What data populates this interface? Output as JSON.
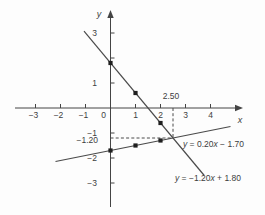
{
  "figure": {
    "background": "#fdfdfd",
    "axis_color": "#444444",
    "line_color": "#4a4a4a",
    "marker_color": "#1f1f1f",
    "guide_color": "#4a4a4a",
    "text_color": "#3d3d3d"
  },
  "chart_data": {
    "type": "line",
    "title": "",
    "xlabel": "x",
    "ylabel": "y",
    "xlim": [
      -3.8,
      5.3
    ],
    "ylim": [
      -3.9,
      3.9
    ],
    "grid": false,
    "x_ticks": [
      {
        "v": -3,
        "label": "−3"
      },
      {
        "v": -2,
        "label": "−2"
      },
      {
        "v": -1,
        "label": "−1"
      },
      {
        "v": 1,
        "label": "1"
      },
      {
        "v": 2,
        "label": "2"
      },
      {
        "v": 3,
        "label": "3"
      },
      {
        "v": 4,
        "label": "4"
      }
    ],
    "y_ticks": [
      {
        "v": 3,
        "label": "3"
      },
      {
        "v": 2,
        "label": ""
      },
      {
        "v": 1,
        "label": "1"
      },
      {
        "v": -1,
        "label": "−1"
      },
      {
        "v": -2,
        "label": "−2"
      },
      {
        "v": -3,
        "label": "−3"
      }
    ],
    "origin_label": "0",
    "series": [
      {
        "name": "y = −1.20x + 1.80",
        "slope": -1.2,
        "intercept": 1.8,
        "x_range": [
          -1.06,
          3.75
        ],
        "points": [
          [
            0,
            1.8
          ],
          [
            1,
            0.6
          ],
          [
            2,
            -0.6
          ]
        ],
        "label_parts": [
          {
            "t": "y",
            "i": 1
          },
          {
            "t": " = −1.20",
            "i": 0
          },
          {
            "t": "x",
            "i": 1
          },
          {
            "t": " + 1.80",
            "i": 0
          }
        ],
        "label_pos": [
          2.58,
          -2.92
        ]
      },
      {
        "name": "y = 0.20x − 1.70",
        "slope": 0.2,
        "intercept": -1.7,
        "x_range": [
          -2.2,
          4.8
        ],
        "points": [
          [
            0,
            -1.7
          ],
          [
            1,
            -1.5
          ],
          [
            2,
            -1.3
          ]
        ],
        "label_parts": [
          {
            "t": "y",
            "i": 1
          },
          {
            "t": " = 0.20",
            "i": 0
          },
          {
            "t": "x",
            "i": 1
          },
          {
            "t": " − 1.70",
            "i": 0
          }
        ],
        "label_pos": [
          2.9,
          -1.56
        ]
      }
    ],
    "intersection": {
      "x": 2.5,
      "y": -1.2,
      "x_guide_label": "2.50",
      "y_guide_label": "−1.20"
    }
  }
}
